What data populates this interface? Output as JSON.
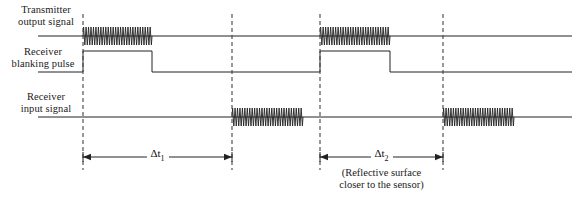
{
  "figure": {
    "type": "timing-diagram",
    "width": 580,
    "height": 200,
    "background": "#ffffff",
    "stroke_color": "#222222"
  },
  "rows": [
    {
      "id": "transmitter",
      "label_line1": "Transmitter",
      "label_line2": "output signal",
      "baseline_y": 36,
      "bursts": [
        {
          "x_start": 83,
          "x_end": 152,
          "amplitude": 9,
          "cycles": 28
        },
        {
          "x_start": 320,
          "x_end": 390,
          "amplitude": 9,
          "cycles": 28
        }
      ]
    },
    {
      "id": "blanking",
      "label_line1": "Receiver",
      "label_line2": "blanking pulse",
      "baseline_y": 72,
      "high_y": 51,
      "pulses": [
        {
          "rise_x": 83,
          "fall_x": 152
        },
        {
          "rise_x": 320,
          "fall_x": 390
        }
      ]
    },
    {
      "id": "receiver",
      "label_line1": "Receiver",
      "label_line2": "input signal",
      "baseline_y": 117,
      "bursts": [
        {
          "x_start": 232,
          "x_end": 303,
          "amplitude": 9,
          "cycles": 29
        },
        {
          "x_start": 443,
          "x_end": 514,
          "amplitude": 9,
          "cycles": 29
        }
      ]
    }
  ],
  "dashed_lines": [
    {
      "id": "t0-first",
      "x": 83,
      "y_top": 14,
      "y_bottom": 170
    },
    {
      "id": "echo-first",
      "x": 232,
      "y_top": 14,
      "y_bottom": 170
    },
    {
      "id": "t0-second",
      "x": 320,
      "y_top": 14,
      "y_bottom": 170
    },
    {
      "id": "echo-second",
      "x": 443,
      "y_top": 14,
      "y_bottom": 170
    }
  ],
  "measurements": [
    {
      "id": "delta-t1",
      "symbol": "Δt",
      "subscript": "1",
      "x_start": 83,
      "x_end": 232,
      "y": 157,
      "note": ""
    },
    {
      "id": "delta-t2",
      "symbol": "Δt",
      "subscript": "2",
      "x_start": 320,
      "x_end": 443,
      "y": 157,
      "note_line1": "(Reflective surface",
      "note_line2": "closer to the sensor)"
    }
  ],
  "baseline_extent": {
    "x_start": 38,
    "x_end": 572
  }
}
